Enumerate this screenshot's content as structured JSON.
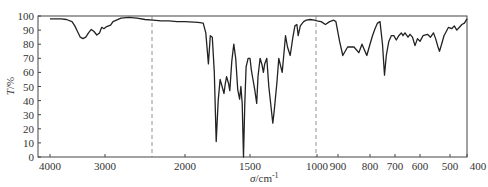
{
  "chart_data": {
    "type": "line",
    "title": "",
    "xlabel": "σ/cm⁻¹",
    "ylabel": "T/%",
    "xlim": [
      4000,
      400
    ],
    "ylim": [
      0,
      100
    ],
    "grid": false,
    "x_ticks": [
      4000,
      3000,
      2000,
      1500,
      1000,
      900,
      800,
      700,
      600,
      500,
      400
    ],
    "y_ticks": [
      0,
      10,
      20,
      30,
      40,
      50,
      60,
      70,
      80,
      90,
      100
    ],
    "scale_break": "compressed above 2000 cm⁻¹ (two scales, break at dashed lines ~2200 and 1000)",
    "reference_lines": [
      2200,
      1000
    ],
    "series": [
      {
        "name": "IR transmittance",
        "points": [
          [
            4000,
            98
          ],
          [
            3900,
            98
          ],
          [
            3800,
            98
          ],
          [
            3700,
            97.5
          ],
          [
            3600,
            96
          ],
          [
            3550,
            93
          ],
          [
            3500,
            89
          ],
          [
            3450,
            85
          ],
          [
            3400,
            84
          ],
          [
            3350,
            85
          ],
          [
            3300,
            88
          ],
          [
            3250,
            90.5
          ],
          [
            3200,
            89
          ],
          [
            3150,
            86.5
          ],
          [
            3100,
            88
          ],
          [
            3060,
            92
          ],
          [
            3020,
            91
          ],
          [
            2980,
            92.5
          ],
          [
            2930,
            93.5
          ],
          [
            2900,
            96
          ],
          [
            2800,
            98.5
          ],
          [
            2700,
            99
          ],
          [
            2600,
            98.5
          ],
          [
            2500,
            97.5
          ],
          [
            2400,
            97
          ],
          [
            2300,
            96.5
          ],
          [
            2200,
            96.5
          ],
          [
            2100,
            96
          ],
          [
            2000,
            96
          ],
          [
            1900,
            95.5
          ],
          [
            1860,
            95
          ],
          [
            1840,
            88
          ],
          [
            1820,
            66
          ],
          [
            1805,
            86
          ],
          [
            1790,
            85
          ],
          [
            1775,
            60
          ],
          [
            1760,
            11
          ],
          [
            1745,
            40
          ],
          [
            1730,
            55
          ],
          [
            1715,
            50
          ],
          [
            1700,
            45
          ],
          [
            1690,
            52
          ],
          [
            1680,
            57
          ],
          [
            1665,
            52
          ],
          [
            1655,
            47
          ],
          [
            1640,
            68
          ],
          [
            1625,
            80
          ],
          [
            1610,
            70
          ],
          [
            1595,
            48
          ],
          [
            1580,
            41
          ],
          [
            1570,
            50
          ],
          [
            1560,
            38
          ],
          [
            1550,
            0
          ],
          [
            1540,
            38
          ],
          [
            1530,
            64
          ],
          [
            1515,
            70
          ],
          [
            1500,
            70
          ],
          [
            1490,
            62
          ],
          [
            1480,
            56
          ],
          [
            1465,
            48
          ],
          [
            1450,
            38
          ],
          [
            1440,
            57
          ],
          [
            1425,
            70
          ],
          [
            1410,
            65
          ],
          [
            1400,
            60
          ],
          [
            1390,
            66
          ],
          [
            1375,
            70
          ],
          [
            1360,
            50
          ],
          [
            1345,
            37
          ],
          [
            1330,
            24
          ],
          [
            1320,
            32
          ],
          [
            1300,
            52
          ],
          [
            1285,
            70
          ],
          [
            1275,
            66
          ],
          [
            1260,
            60
          ],
          [
            1250,
            70
          ],
          [
            1235,
            86
          ],
          [
            1220,
            78
          ],
          [
            1200,
            72
          ],
          [
            1180,
            85
          ],
          [
            1165,
            93
          ],
          [
            1150,
            94
          ],
          [
            1140,
            86
          ],
          [
            1125,
            93
          ],
          [
            1100,
            96
          ],
          [
            1080,
            97
          ],
          [
            1050,
            97.5
          ],
          [
            1020,
            97
          ],
          [
            1000,
            96.5
          ],
          [
            980,
            96
          ],
          [
            960,
            94
          ],
          [
            940,
            96
          ],
          [
            920,
            97
          ],
          [
            910,
            96
          ],
          [
            895,
            82
          ],
          [
            885,
            72
          ],
          [
            870,
            78
          ],
          [
            850,
            78
          ],
          [
            835,
            74
          ],
          [
            825,
            80
          ],
          [
            810,
            72
          ],
          [
            800,
            80
          ],
          [
            790,
            86
          ],
          [
            780,
            91
          ],
          [
            770,
            95
          ],
          [
            760,
            96
          ],
          [
            750,
            80
          ],
          [
            742,
            58
          ],
          [
            735,
            72
          ],
          [
            725,
            82
          ],
          [
            715,
            86
          ],
          [
            705,
            86
          ],
          [
            695,
            83
          ],
          [
            685,
            86
          ],
          [
            675,
            88
          ],
          [
            668,
            86
          ],
          [
            660,
            88
          ],
          [
            648,
            85
          ],
          [
            640,
            87
          ],
          [
            630,
            85
          ],
          [
            620,
            79
          ],
          [
            610,
            84
          ],
          [
            600,
            82
          ],
          [
            590,
            86
          ],
          [
            575,
            87
          ],
          [
            565,
            85
          ],
          [
            555,
            88
          ],
          [
            548,
            84
          ],
          [
            540,
            78
          ],
          [
            535,
            75
          ],
          [
            528,
            80
          ],
          [
            520,
            86
          ],
          [
            505,
            92
          ],
          [
            490,
            91
          ],
          [
            475,
            93
          ],
          [
            460,
            90
          ],
          [
            445,
            92
          ],
          [
            430,
            94
          ],
          [
            415,
            95
          ],
          [
            400,
            98
          ]
        ]
      }
    ]
  },
  "axes": {
    "x_label_prefix": "σ",
    "x_label_unit": "/cm",
    "x_label_exp": "-1",
    "y_label_prefix": "T",
    "y_label_unit": "/%"
  }
}
